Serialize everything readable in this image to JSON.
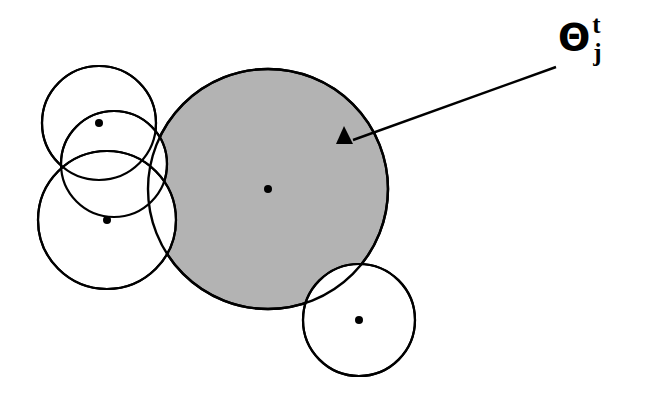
{
  "figure": {
    "background_color": "#ffffff",
    "stroke_color": "#000000",
    "shaded_fill_color": "#b3b3b3",
    "unshaded_fill_color": "#ffffff",
    "width": 672,
    "height": 395
  },
  "annotation": {
    "symbol": "Θ",
    "superscript": "t",
    "subscript": "j",
    "marker": "filled-triangle"
  },
  "chart_data": {
    "type": "scatter",
    "title": "",
    "xlabel": "",
    "ylabel": "",
    "xlim": [
      0,
      672
    ],
    "ylim": [
      0,
      395
    ],
    "grid": false,
    "legend": null,
    "circles": [
      {
        "name": "top-left-circle",
        "cx": 99,
        "cy": 123,
        "r": 57,
        "shaded": false,
        "has_center_dot": true
      },
      {
        "name": "middle-left-circle",
        "cx": 114,
        "cy": 164,
        "r": 53,
        "shaded": false,
        "has_center_dot": false
      },
      {
        "name": "bottom-left-circle",
        "cx": 107,
        "cy": 220,
        "r": 69,
        "shaded": false,
        "has_center_dot": true
      },
      {
        "name": "large-shaded-circle",
        "cx": 268,
        "cy": 189,
        "r": 120,
        "shaded": true,
        "has_center_dot": true
      },
      {
        "name": "bottom-right-circle",
        "cx": 359,
        "cy": 320,
        "r": 56,
        "shaded": false,
        "has_center_dot": true
      }
    ],
    "center_dots": [
      {
        "name": "top-left-center-dot",
        "x": 99,
        "y": 123,
        "r": 4
      },
      {
        "name": "bottom-left-center-dot",
        "x": 107,
        "y": 220,
        "r": 4
      },
      {
        "name": "large-circle-center-dot",
        "x": 268,
        "y": 189,
        "r": 4
      },
      {
        "name": "bottom-right-center-dot",
        "x": 359,
        "y": 320,
        "r": 4
      }
    ],
    "triangle_marker": {
      "name": "triangle-marker",
      "x": 344,
      "y": 137,
      "size": 16,
      "points": "336,144 344,126 353,144"
    },
    "leader_line": {
      "name": "leader-line",
      "x1": 353,
      "y1": 140,
      "x2": 556,
      "y2": 67
    },
    "label_position": {
      "x": 558,
      "y": 18
    }
  }
}
